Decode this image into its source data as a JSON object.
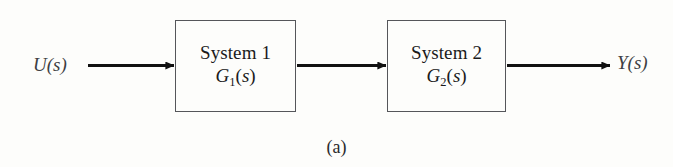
{
  "figure": {
    "caption": "(a)",
    "type": "block-diagram-series-connection",
    "background_color": "#fdfdfb",
    "line_color": "#111111",
    "box_border_color": "#55565a",
    "label_color": "#3e3f43"
  },
  "signals": {
    "input": {
      "text": "U(s)",
      "variable": "U",
      "argument": "s"
    },
    "output": {
      "text": "Y(s)",
      "variable": "Y",
      "argument": "s"
    }
  },
  "blocks": [
    {
      "title": "System 1",
      "transfer_function": "G_1(s)",
      "tf_base": "G",
      "tf_subscript": "1",
      "tf_argument": "s"
    },
    {
      "title": "System 2",
      "transfer_function": "G_2(s)",
      "tf_base": "G",
      "tf_subscript": "2",
      "tf_argument": "s"
    }
  ],
  "arrows": [
    {
      "name": "input-arrow",
      "from": "U(s)",
      "to": "System 1"
    },
    {
      "name": "interconnect-arrow",
      "from": "System 1",
      "to": "System 2"
    },
    {
      "name": "output-arrow",
      "from": "System 2",
      "to": "Y(s)"
    }
  ]
}
